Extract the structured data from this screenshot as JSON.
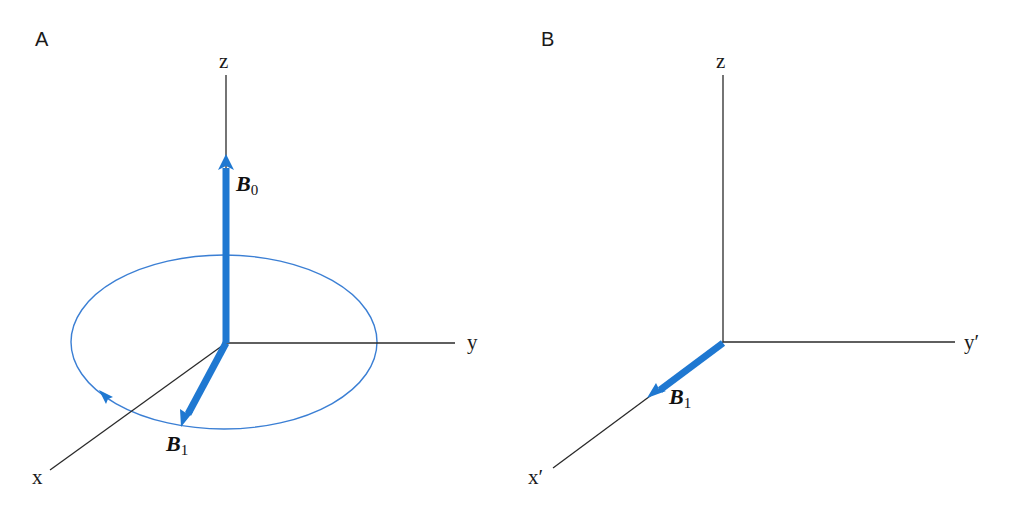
{
  "colors": {
    "axis": "#2a2a2a",
    "vector": "#1f78d1",
    "circle": "#3b7fd4"
  },
  "panels": [
    {
      "id": "A",
      "label": "A",
      "axes": {
        "z": "z",
        "y": "y",
        "x": "x"
      },
      "vectors": [
        {
          "name": "B",
          "subscript": "0",
          "direction": "along z"
        },
        {
          "name": "B",
          "subscript": "1",
          "direction": "rotating in x-y plane"
        }
      ],
      "rotation": "circular path in x-y plane with arrow"
    },
    {
      "id": "B",
      "label": "B",
      "axes": {
        "z": "z",
        "y": "y′",
        "x": "x′"
      },
      "vectors": [
        {
          "name": "B",
          "subscript": "1",
          "direction": "along x′"
        }
      ]
    }
  ]
}
